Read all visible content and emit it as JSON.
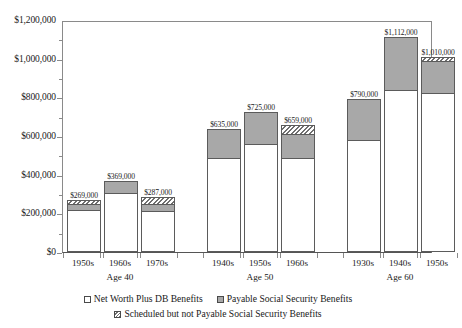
{
  "chart_data": {
    "type": "bar",
    "subtype": "stacked-grouped",
    "title": "",
    "xlabel": "",
    "ylabel": "",
    "ylim": [
      0,
      1200000
    ],
    "grid": false,
    "legend_position": "bottom",
    "y_ticks": [
      "$0",
      "$200,000",
      "$400,000",
      "$600,000",
      "$800,000",
      "$1,000,000",
      "$1,200,000"
    ],
    "y_tick_values": [
      0,
      200000,
      400000,
      600000,
      800000,
      1000000,
      1200000
    ],
    "groups": [
      "Age 40",
      "Age 50",
      "Age 60"
    ],
    "categories": [
      "1950s",
      "1960s",
      "1970s",
      "1940s",
      "1950s",
      "1960s",
      "1930s",
      "1940s",
      "1950s"
    ],
    "series": [
      {
        "name": "Net Worth Plus DB Benefits",
        "values": [
          215000,
          305000,
          210000,
          485000,
          558000,
          485000,
          580000,
          838000,
          820000
        ]
      },
      {
        "name": "Payable Social Security Benefits",
        "values": [
          35000,
          64000,
          37000,
          150000,
          167000,
          128000,
          210000,
          274000,
          170000
        ]
      },
      {
        "name": "Scheduled but not Payable Social Security Benefits",
        "values": [
          19000,
          0,
          40000,
          0,
          0,
          46000,
          0,
          0,
          20000
        ]
      }
    ],
    "totals": [
      269000,
      369000,
      287000,
      635000,
      725000,
      659000,
      790000,
      1112000,
      1010000
    ],
    "total_labels": [
      "$269,000",
      "$369,000",
      "$287,000",
      "$635,000",
      "$725,000",
      "$659,000",
      "$790,000",
      "$1,112,000",
      "$1,010,000"
    ],
    "colors": {
      "net_worth": "#ffffff",
      "payable": "#a8a8a8",
      "scheduled": "#6f6f6f",
      "outline": "#5b5b5b",
      "axis": "#8a8a8a",
      "text": "#1a1a1a",
      "background": "#ffffff"
    }
  },
  "axis": {
    "y_labels": [
      {
        "text": "$1,200,000",
        "value": 1200000
      },
      {
        "text": "$1,000,000",
        "value": 1000000
      },
      {
        "text": "$800,000",
        "value": 800000
      },
      {
        "text": "$600,000",
        "value": 600000
      },
      {
        "text": "$400,000",
        "value": 400000
      },
      {
        "text": "$200,000",
        "value": 200000
      },
      {
        "text": "$0",
        "value": 0
      }
    ],
    "x_categories": [
      {
        "label": "1950s"
      },
      {
        "label": "1960s"
      },
      {
        "label": "1970s"
      },
      {
        "label": "1940s"
      },
      {
        "label": "1950s"
      },
      {
        "label": "1960s"
      },
      {
        "label": "1930s"
      },
      {
        "label": "1940s"
      },
      {
        "label": "1950s"
      }
    ],
    "x_groups": [
      {
        "label": "Age 40"
      },
      {
        "label": "Age 50"
      },
      {
        "label": "Age 60"
      }
    ]
  },
  "bars": [
    {
      "category": "1950s",
      "group": "Age 40",
      "total_label": "$269,000",
      "net_worth": 215000,
      "payable": 35000,
      "scheduled": 19000
    },
    {
      "category": "1960s",
      "group": "Age 40",
      "total_label": "$369,000",
      "net_worth": 305000,
      "payable": 64000,
      "scheduled": 0
    },
    {
      "category": "1970s",
      "group": "Age 40",
      "total_label": "$287,000",
      "net_worth": 210000,
      "payable": 37000,
      "scheduled": 40000
    },
    {
      "category": "1940s",
      "group": "Age 50",
      "total_label": "$635,000",
      "net_worth": 485000,
      "payable": 150000,
      "scheduled": 0
    },
    {
      "category": "1950s",
      "group": "Age 50",
      "total_label": "$725,000",
      "net_worth": 558000,
      "payable": 167000,
      "scheduled": 0
    },
    {
      "category": "1960s",
      "group": "Age 50",
      "total_label": "$659,000",
      "net_worth": 485000,
      "payable": 128000,
      "scheduled": 46000
    },
    {
      "category": "1930s",
      "group": "Age 60",
      "total_label": "$790,000",
      "net_worth": 580000,
      "payable": 210000,
      "scheduled": 0
    },
    {
      "category": "1940s",
      "group": "Age 60",
      "total_label": "$1,112,000",
      "net_worth": 838000,
      "payable": 274000,
      "scheduled": 0
    },
    {
      "category": "1950s",
      "group": "Age 60",
      "total_label": "$1,010,000",
      "net_worth": 820000,
      "payable": 170000,
      "scheduled": 20000
    }
  ],
  "legend": {
    "items": [
      {
        "label": "Net Worth Plus DB Benefits",
        "swatch": "white-square-icon"
      },
      {
        "label": "Payable Social Security Benefits",
        "swatch": "gray-square-icon"
      },
      {
        "label": "Scheduled but not Payable Social Security Benefits",
        "swatch": "hatched-square-icon"
      }
    ]
  }
}
